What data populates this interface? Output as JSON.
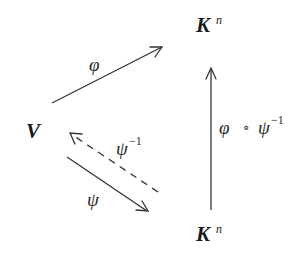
{
  "diagram": {
    "type": "commutative-diagram",
    "nodes": {
      "V": {
        "base": "V",
        "sup": ""
      },
      "Kn_top": {
        "base": "K",
        "sup": "n"
      },
      "Kn_bottom": {
        "base": "K",
        "sup": "n"
      }
    },
    "edges": {
      "phi": {
        "from": "V",
        "to": "Kn_top",
        "label": "φ",
        "style": "solid"
      },
      "psi": {
        "from": "V",
        "to": "Kn_bottom",
        "label": "ψ",
        "style": "solid"
      },
      "psi_inv": {
        "from": "Kn_bottom",
        "to": "V",
        "label": "ψ",
        "label_sup": "−1",
        "style": "dashed"
      },
      "composite": {
        "from": "Kn_bottom",
        "to": "Kn_top",
        "label_a": "φ",
        "label_op": "∘",
        "label_b": "ψ",
        "label_sup": "−1",
        "style": "solid"
      }
    },
    "colors": {
      "ink": "#333333",
      "background": "#ffffff"
    }
  }
}
